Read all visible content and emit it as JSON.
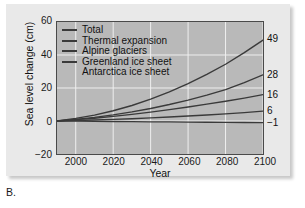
{
  "figure": {
    "caption": "B."
  },
  "chart_data": {
    "type": "line",
    "title": "",
    "xlabel": "Year",
    "ylabel": "Sea level change (cm)",
    "xlim": [
      1990,
      2100
    ],
    "ylim": [
      -20,
      60
    ],
    "xticks": [
      2000,
      2020,
      2040,
      2060,
      2080,
      2100
    ],
    "yticks": [
      -20,
      0,
      20,
      40,
      60
    ],
    "xtick_labels": [
      "2000",
      "2020",
      "2040",
      "2060",
      "2080",
      "2100"
    ],
    "ytick_labels": [
      "60",
      "40",
      "20",
      "0",
      "-20"
    ],
    "grid": true,
    "grid_color": "#f0f0f0",
    "plot_bg": "#b9b9b9",
    "line_color": "#3a3a3a",
    "legend_position": "top-left",
    "x": [
      1990,
      2000,
      2010,
      2020,
      2030,
      2040,
      2050,
      2060,
      2070,
      2080,
      2090,
      2100
    ],
    "series": [
      {
        "name": "Total",
        "has_legend_swatch": true,
        "end_label": "49",
        "end_value": 49,
        "values": [
          0,
          1.6,
          3.6,
          6.2,
          9.4,
          13.2,
          17.6,
          22.6,
          28.2,
          34.4,
          41.4,
          49
        ]
      },
      {
        "name": "Thermal expansion",
        "has_legend_swatch": true,
        "end_label": "28",
        "end_value": 28,
        "values": [
          0,
          1.0,
          2.2,
          3.7,
          5.5,
          7.6,
          10.0,
          12.7,
          15.7,
          19.0,
          23.3,
          28
        ]
      },
      {
        "name": "Alpine glaciers",
        "has_legend_swatch": true,
        "end_label": "16",
        "end_value": 16,
        "values": [
          0,
          0.8,
          1.7,
          2.8,
          4.0,
          5.4,
          6.9,
          8.5,
          10.2,
          12.0,
          13.9,
          16
        ]
      },
      {
        "name": "Greenland ice sheet",
        "has_legend_swatch": true,
        "end_label": "6",
        "end_value": 6,
        "values": [
          0,
          0.3,
          0.6,
          1.0,
          1.4,
          1.9,
          2.4,
          3.0,
          3.6,
          4.3,
          5.1,
          6
        ]
      },
      {
        "name": "Antarctica ice sheet",
        "has_legend_swatch": false,
        "end_label": "-1",
        "end_value": -1,
        "values": [
          0,
          -0.1,
          -0.2,
          -0.3,
          -0.4,
          -0.5,
          -0.55,
          -0.65,
          -0.75,
          -0.85,
          -0.92,
          -1
        ]
      }
    ]
  }
}
